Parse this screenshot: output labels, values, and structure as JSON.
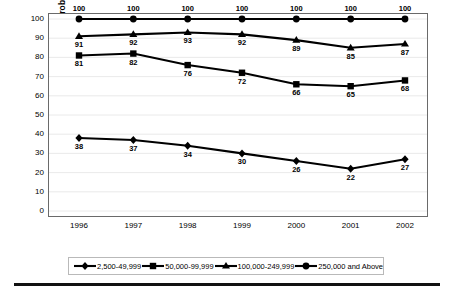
{
  "chart_data": {
    "type": "line",
    "title": "",
    "xlabel": "",
    "ylabel": "Percent Reporting Gang Problems",
    "categories": [
      "1996",
      "1997",
      "1998",
      "1999",
      "2000",
      "2001",
      "2002"
    ],
    "ylim": [
      0,
      100
    ],
    "yticks": [
      "0",
      "10",
      "20",
      "30",
      "40",
      "50",
      "60",
      "70",
      "80",
      "90",
      "100"
    ],
    "grid": true,
    "legend_position": "bottom",
    "series": [
      {
        "name": "2,500-49,999",
        "marker": "diamond",
        "color": "#000000",
        "label_position": "below",
        "values": [
          38,
          37,
          34,
          30,
          26,
          22,
          27
        ]
      },
      {
        "name": "50,000-99,999",
        "marker": "square",
        "color": "#000000",
        "label_position": "below",
        "values": [
          81,
          82,
          76,
          72,
          66,
          65,
          68
        ]
      },
      {
        "name": "100,000-249,999",
        "marker": "triangle",
        "color": "#000000",
        "label_position": "below",
        "values": [
          91,
          92,
          93,
          92,
          89,
          85,
          87
        ]
      },
      {
        "name": "250,000 and Above",
        "marker": "circle",
        "color": "#000000",
        "label_position": "above",
        "values": [
          100,
          100,
          100,
          100,
          100,
          100,
          100
        ]
      }
    ]
  },
  "legend": {
    "items": [
      {
        "label": "2,500-49,999",
        "marker": "diamond"
      },
      {
        "label": "50,000-99,999",
        "marker": "square"
      },
      {
        "label": "100,000-249,999",
        "marker": "triangle"
      },
      {
        "label": "250,000 and Above",
        "marker": "circle"
      }
    ]
  }
}
